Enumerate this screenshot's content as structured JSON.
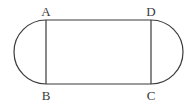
{
  "figure": {
    "stroke_color": "#3a3a3a",
    "background": "#ffffff",
    "points": {
      "A": {
        "label": "A",
        "x": 46,
        "y": 20
      },
      "B": {
        "label": "B",
        "x": 46,
        "y": 84
      },
      "C": {
        "label": "C",
        "x": 151,
        "y": 84
      },
      "D": {
        "label": "D",
        "x": 151,
        "y": 20
      }
    },
    "semicircle_radius": 32
  }
}
